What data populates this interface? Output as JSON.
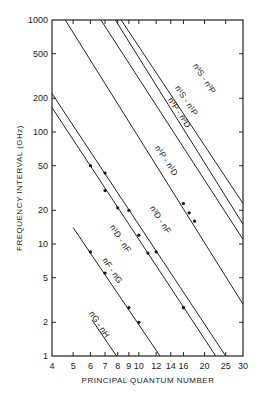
{
  "chart_data": {
    "type": "line",
    "scale": {
      "x": "log",
      "y": "log"
    },
    "xlabel": "PRINCIPAL QUANTUM NUMBER",
    "ylabel": "FREQUENCY INTERVAL (GHz)",
    "xlim": [
      4,
      30
    ],
    "ylim": [
      1,
      1000
    ],
    "grid": false,
    "x_ticks": [
      4,
      5,
      6,
      7,
      8,
      9,
      10,
      12,
      14,
      16,
      20,
      25,
      30
    ],
    "x_tick_labels": [
      "4",
      "5",
      "6",
      "7",
      "8",
      "9",
      "10",
      "12",
      "14",
      "16",
      "20",
      "25",
      "30"
    ],
    "y_ticks": [
      1,
      2,
      5,
      10,
      20,
      50,
      100,
      200,
      500,
      1000
    ],
    "y_tick_labels": [
      "1",
      "2",
      "5",
      "10",
      "20",
      "50",
      "100",
      "200",
      "500",
      "1000"
    ],
    "series": [
      {
        "name": "n3S-n3P",
        "label_main": "n",
        "label_text": "S - n",
        "endpoints": [
          [
            8.3,
            1000
          ],
          [
            30,
            23
          ]
        ],
        "points": []
      },
      {
        "name": "n1S-n1P",
        "endpoints": [
          [
            7.8,
            1000
          ],
          [
            30,
            15
          ]
        ],
        "points": []
      },
      {
        "name": "n3P-n3D",
        "endpoints": [
          [
            6.7,
            1000
          ],
          [
            30,
            11
          ]
        ],
        "points": []
      },
      {
        "name": "n1P-n1D",
        "endpoints": [
          [
            4.6,
            1000
          ],
          [
            30,
            2.9
          ]
        ],
        "points": [
          [
            16,
            23
          ],
          [
            17,
            19
          ],
          [
            18,
            16
          ]
        ]
      },
      {
        "name": "n3D-nF",
        "endpoints": [
          [
            4,
            220
          ],
          [
            25,
            1
          ]
        ],
        "points": [
          [
            6,
            50
          ],
          [
            7,
            43
          ],
          [
            9,
            20
          ],
          [
            12,
            8.5
          ],
          [
            16,
            2.7
          ]
        ]
      },
      {
        "name": "n1D-nF",
        "endpoints": [
          [
            4,
            165
          ],
          [
            22.5,
            1
          ]
        ],
        "points": [
          [
            7,
            30
          ],
          [
            8,
            21
          ],
          [
            10,
            12
          ],
          [
            11,
            8.3
          ],
          [
            16,
            2.7
          ]
        ]
      },
      {
        "name": "nF-nG",
        "endpoints": [
          [
            5,
            14
          ],
          [
            12.5,
            1
          ]
        ],
        "points": [
          [
            6,
            8.5
          ],
          [
            7,
            5.5
          ],
          [
            9,
            2.7
          ],
          [
            10,
            2.0
          ]
        ]
      },
      {
        "name": "nG-nH",
        "endpoints": [
          [
            6.1,
            2.1
          ],
          [
            7.9,
            1
          ]
        ],
        "points": []
      }
    ],
    "labels": [
      {
        "text": "n³S - n³P",
        "series": "n3S-n3P"
      },
      {
        "text": "n¹S - n¹P",
        "series": "n1S-n1P"
      },
      {
        "text": "n³P - n³D",
        "series": "n3P-n3D"
      },
      {
        "text": "n¹P - n¹D",
        "series": "n1P-n1D"
      },
      {
        "text": "n³D - nF",
        "series": "n3D-nF"
      },
      {
        "text": "n¹D - nF",
        "series": "n1D-nF"
      },
      {
        "text": "nF - nG",
        "series": "nF-nG"
      },
      {
        "text": "nG - nH",
        "series": "nG-nH"
      }
    ]
  },
  "labels": {
    "l0": "n³S - n³P",
    "l1": "n¹S - n¹P",
    "l2": "n³P - n³D",
    "l3": "n¹P - n¹D",
    "l4": "n³D - nF",
    "l5": "n¹D - nF",
    "l6": "nF - nG",
    "l7": "nG - nH"
  },
  "axes": {
    "xlabel": "PRINCIPAL QUANTUM NUMBER",
    "ylabel": "FREQUENCY INTERVAL (GHz)",
    "x_ticks": [
      "4",
      "5",
      "6",
      "7",
      "8",
      "9",
      "10",
      "12",
      "14",
      "16",
      "20",
      "25",
      "30"
    ],
    "y_ticks": [
      "1",
      "2",
      "5",
      "10",
      "20",
      "50",
      "100",
      "200",
      "500",
      "1000"
    ]
  }
}
